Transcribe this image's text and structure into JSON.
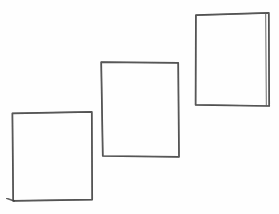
{
  "canvas": {
    "width": 279,
    "height": 214,
    "background_color": "#fefefe",
    "title": "hand-drawn rectangles sketch",
    "description": "Three hand-drawn pencil rectangles arranged in an ascending diagonal staircase from lower-left to upper-right on a plain white background."
  },
  "style": {
    "stroke_color": "#3a3a3a",
    "stroke_color_light": "#6b6b6b",
    "stroke_color_dark": "#2b2b2b",
    "stroke_width": 1.6,
    "medium": "pencil"
  },
  "shapes": [
    {
      "id": "rect-lower-left",
      "label": "lower-left rectangle",
      "order": 1,
      "position": "lower-left",
      "corners": {
        "top_left": [
          12,
          113
        ],
        "top_right": [
          92,
          112
        ],
        "bottom_right": [
          92,
          200
        ],
        "bottom_left": [
          13,
          201
        ]
      },
      "width": 80,
      "height": 88,
      "path": "M12.4,113.4 L91.8,111.9 L92.2,199.6 L13.2,200.8 Z",
      "overshoot_path": "M6.5,198.2 L14.2,201.0",
      "stroke_width": 1.7
    },
    {
      "id": "rect-middle",
      "label": "middle rectangle",
      "order": 2,
      "position": "center",
      "corners": {
        "top_left": [
          101,
          62
        ],
        "top_right": [
          178,
          63
        ],
        "bottom_right": [
          179,
          157
        ],
        "bottom_left": [
          103,
          156
        ]
      },
      "width": 77,
      "height": 94,
      "path": "M101.2,62.2 L178.2,62.8 L179.0,156.8 L102.8,156.0 Z",
      "overshoot_path": "",
      "stroke_width": 1.7
    },
    {
      "id": "rect-upper-right",
      "label": "upper-right rectangle",
      "order": 3,
      "position": "upper-right",
      "corners": {
        "top_left": [
          196,
          15
        ],
        "top_right": [
          269,
          13
        ],
        "bottom_right": [
          269,
          106
        ],
        "bottom_left": [
          196,
          105
        ]
      },
      "width": 73,
      "height": 92,
      "path": "M195.9,15.2 L268.8,12.9 L269.2,106.0 L195.6,104.8 Z",
      "overshoot_path": "M265.6,13.4 L266.4,105.6",
      "stroke_width": 1.7
    }
  ]
}
